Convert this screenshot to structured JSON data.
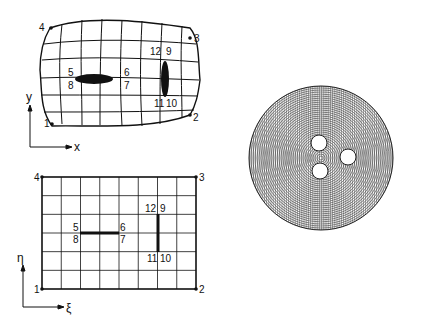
{
  "physical_domain": {
    "axis_x": "x",
    "axis_y": "y",
    "corner_labels": [
      "1",
      "2",
      "3",
      "4"
    ],
    "slit_labels": {
      "horizontal": {
        "top_left": "5",
        "top_right": "6",
        "bottom_right": "7",
        "bottom_left": "8"
      },
      "vertical": {
        "top_right": "9",
        "bottom_right": "10",
        "bottom_left": "11",
        "top_left": "12"
      }
    }
  },
  "computational_domain": {
    "axis_xi": "ξ",
    "axis_eta": "η",
    "corner_labels": [
      "1",
      "2",
      "3",
      "4"
    ],
    "columns": 8,
    "rows": 6,
    "slit_labels": {
      "horizontal": {
        "top_left": "5",
        "top_right": "6",
        "bottom_right": "7",
        "bottom_left": "8"
      },
      "vertical": {
        "top_right": "9",
        "bottom_right": "10",
        "bottom_left": "11",
        "top_left": "12"
      }
    }
  },
  "circular_mesh": {
    "description": "Body-fitted grid around three circular holes inside a disk",
    "holes": 3
  }
}
